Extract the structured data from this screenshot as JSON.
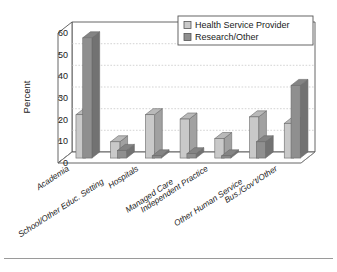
{
  "chart_data": {
    "type": "bar",
    "title": "",
    "subtitle": "",
    "xlabel": "",
    "ylabel": "Percent",
    "ylim": [
      0,
      60
    ],
    "ytick_values": [
      0,
      10,
      20,
      30,
      40,
      50,
      60
    ],
    "ytick_labels": [
      "0",
      "10",
      "20",
      "30",
      "40",
      "50",
      "60"
    ],
    "grid": true,
    "grid_axis": "y",
    "legend_position": "top-right",
    "three_d": true,
    "categories": [
      "Academia",
      "School/Other Educ. Setting",
      "Hospitals",
      "Managed Care",
      "Independent Practice",
      "Other Human Service",
      "Bus./Gov't/Other"
    ],
    "series": [
      {
        "name": "Health Service Provider",
        "color": "#c9c9c9",
        "values": [
          20,
          7.5,
          20,
          18,
          9,
          19,
          16
        ]
      },
      {
        "name": "Research/Other",
        "color": "#8f8f8f",
        "values": [
          55.5,
          3.5,
          1,
          2,
          1,
          7.5,
          33.5
        ]
      }
    ]
  },
  "legend": {
    "entries": [
      {
        "label": "Health Service Provider",
        "swatch": "#c9c9c9"
      },
      {
        "label": "Research/Other",
        "swatch": "#8f8f8f"
      }
    ]
  },
  "axes": {
    "y_title": "Percent"
  },
  "footer": {
    "rule_visible": true
  },
  "colors": {
    "series_light": "#c9c9c9",
    "series_dark": "#8f8f8f",
    "plot_border": "#555555",
    "gridline": "#bfbfbf",
    "text": "#1a1a1a",
    "background": "#ffffff",
    "footer_rule": "#9a9a9a"
  }
}
